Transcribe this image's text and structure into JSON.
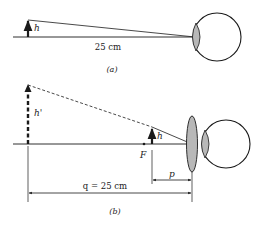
{
  "figure_a": {
    "object_label": "h",
    "distance_label": "25 cm",
    "caption": "(a)"
  },
  "figure_b": {
    "image_label": "h'",
    "object_label": "h",
    "focal_label": "F",
    "p_label": "p",
    "q_label": "q = 25 cm",
    "caption": "(b)"
  },
  "colors": {
    "line": "#1a1a1a",
    "lens_fill": "#b8b8b8"
  }
}
